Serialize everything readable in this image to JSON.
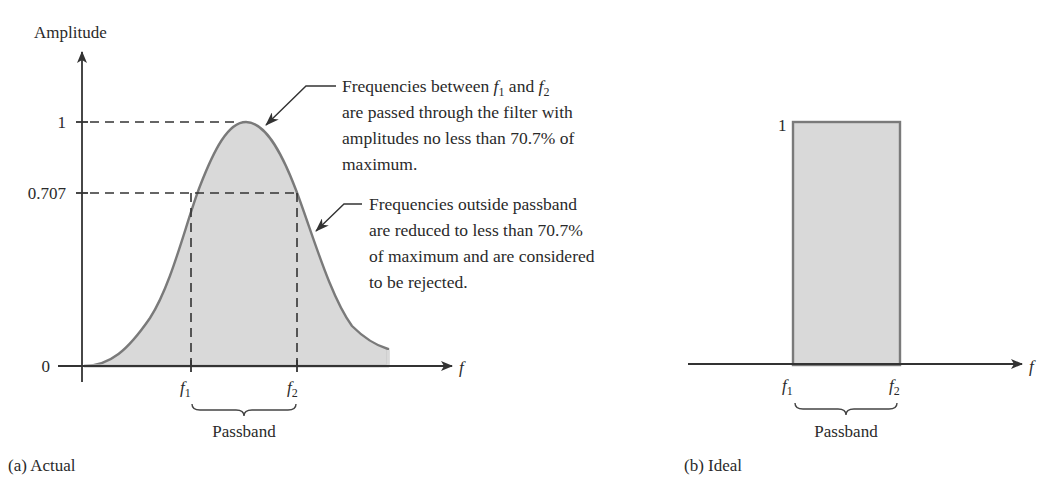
{
  "panel_a": {
    "caption": "(a)  Actual",
    "y_axis_label": "Amplitude",
    "x_axis_label": "f",
    "y_ticks": [
      {
        "label": "1",
        "value": 1
      },
      {
        "label": "0.707",
        "value": 0.707
      },
      {
        "label": "0",
        "value": 0
      }
    ],
    "x_markers": [
      {
        "base": "f",
        "sub": "1"
      },
      {
        "base": "f",
        "sub": "2"
      }
    ],
    "passband_label": "Passband",
    "annotation_1": {
      "line1_prefix": "Frequencies between ",
      "f1_base": "f",
      "f1_sub": "1",
      "and": " and ",
      "f2_base": "f",
      "f2_sub": "2",
      "line2": "are passed through the filter with",
      "line3": "amplitudes no less than 70.7% of",
      "line4": "maximum."
    },
    "annotation_2": {
      "line1": "Frequencies outside passband",
      "line2": "are reduced to less than 70.7%",
      "line3": "of maximum and are considered",
      "line4": "to be rejected."
    }
  },
  "panel_b": {
    "caption": "(b)  Ideal",
    "x_axis_label": "f",
    "y_tick_label": "1",
    "x_markers": [
      {
        "base": "f",
        "sub": "1"
      },
      {
        "base": "f",
        "sub": "2"
      }
    ],
    "passband_label": "Passband"
  },
  "colors": {
    "fill": "#d9d9d9",
    "curve_stroke": "#7a7a7a",
    "axis": "#333333",
    "text": "#2a2a2a"
  }
}
